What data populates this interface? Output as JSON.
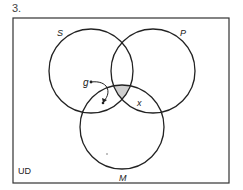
{
  "problem_number": "3.",
  "universe_label": "UD",
  "sets": [
    {
      "name": "S",
      "label": "S"
    },
    {
      "name": "P",
      "label": "P"
    },
    {
      "name": "M",
      "label": "M"
    }
  ],
  "individuals": [
    {
      "name": "g",
      "label": "g"
    }
  ],
  "marks": [
    {
      "name": "x",
      "label": "x"
    }
  ],
  "colors": {
    "line": "#222222",
    "shade": "#cfcfcf"
  }
}
